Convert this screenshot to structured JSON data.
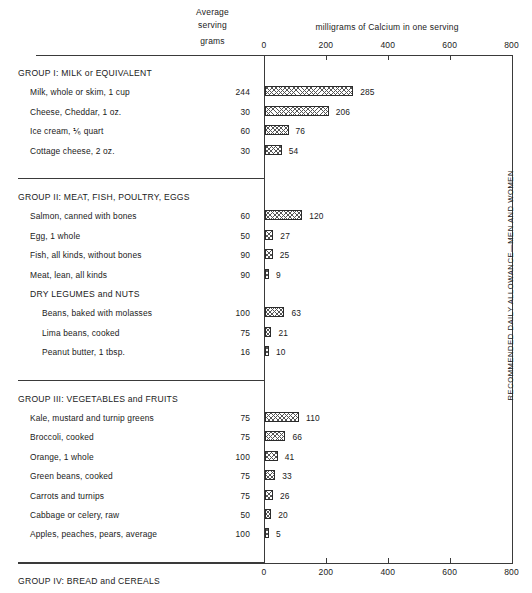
{
  "header": {
    "average_serving_line1": "Average",
    "average_serving_line2": "serving",
    "grams_label": "grams",
    "axis_title": "milligrams of Calcium in one serving"
  },
  "allowance_label": "RECOMMENDED DAILY ALLOWANCE—MEN AND WOMEN",
  "axis": {
    "ticks": [
      "0",
      "200",
      "400",
      "600",
      "800"
    ]
  },
  "chart_data": {
    "type": "bar",
    "title": "milligrams of Calcium in one serving",
    "xlabel": "milligrams of Calcium in one serving",
    "ylabel": "",
    "xlim": [
      0,
      800
    ],
    "orientation": "horizontal",
    "grid": false,
    "legend": false,
    "tick_values": [
      0,
      200,
      400,
      600,
      800
    ],
    "annotations": [
      "RECOMMENDED DAILY ALLOWANCE—MEN AND WOMEN at 800 mg"
    ],
    "groups": [
      {
        "title": "GROUP I: MILK or EQUIVALENT",
        "items": [
          {
            "label": "Milk, whole or skim, 1 cup",
            "grams": "244",
            "value": 285
          },
          {
            "label": "Cheese, Cheddar, 1 oz.",
            "grams": "30",
            "value": 206
          },
          {
            "label": "Ice cream, ⅙ quart",
            "grams": "60",
            "value": 76
          },
          {
            "label": "Cottage cheese, 2 oz.",
            "grams": "30",
            "value": 54
          }
        ]
      },
      {
        "title": "GROUP II: MEAT, FISH, POULTRY, EGGS",
        "items": [
          {
            "label": "Salmon, canned with bones",
            "grams": "60",
            "value": 120
          },
          {
            "label": "Egg, 1 whole",
            "grams": "50",
            "value": 27
          },
          {
            "label": "Fish, all kinds, without bones",
            "grams": "90",
            "value": 25
          },
          {
            "label": "Meat, lean, all kinds",
            "grams": "90",
            "value": 9
          }
        ],
        "subgroup": {
          "title": "DRY LEGUMES and NUTS",
          "items": [
            {
              "label": "Beans, baked with molasses",
              "grams": "100",
              "value": 63
            },
            {
              "label": "Lima beans, cooked",
              "grams": "75",
              "value": 21
            },
            {
              "label": "Peanut butter, 1 tbsp.",
              "grams": "16",
              "value": 10
            }
          ]
        }
      },
      {
        "title": "GROUP III: VEGETABLES and FRUITS",
        "items": [
          {
            "label": "Kale, mustard and turnip greens",
            "grams": "75",
            "value": 110
          },
          {
            "label": "Broccoli, cooked",
            "grams": "75",
            "value": 66
          },
          {
            "label": "Orange, 1 whole",
            "grams": "100",
            "value": 41
          },
          {
            "label": "Green beans, cooked",
            "grams": "75",
            "value": 33
          },
          {
            "label": "Carrots and turnips",
            "grams": "75",
            "value": 26
          },
          {
            "label": "Cabbage or celery, raw",
            "grams": "50",
            "value": 20
          },
          {
            "label": "Apples, peaches, pears, average",
            "grams": "100",
            "value": 5
          }
        ]
      },
      {
        "title": "GROUP IV: BREAD and CEREALS",
        "items": [
          {
            "label": "Bread, white or whole wheat",
            "grams": "70",
            "value": 60
          },
          {
            "label": "Oat cereal, ready to eat, enriched",
            "grams": "25",
            "value": 50
          },
          {
            "label": "Tortilla, Mexican, 2 medium",
            "grams": "40",
            "value": 44
          },
          {
            "label": "Macaroni, spaghetti, noodles, cooked",
            "grams": "100",
            "value": 9
          }
        ]
      }
    ]
  }
}
